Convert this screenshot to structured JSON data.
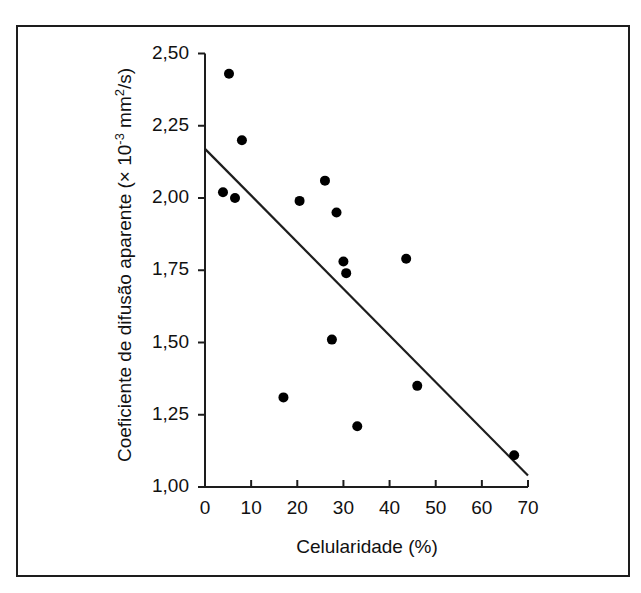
{
  "figure": {
    "background_color": "#ffffff",
    "frame_color": "#1d1d1d",
    "marker_color": "#000000",
    "line_color": "#1d1d1d"
  },
  "chart_data": {
    "type": "scatter",
    "title": "",
    "xlabel": "Celularidade (%)",
    "ylabel_parts": {
      "prefix": "Coeficiente de difusão aparente (× 10",
      "exponent": "-3",
      "suffix_a": " mm",
      "suffix_exp": "2",
      "suffix_b": "/s)"
    },
    "ylabel": "Coeficiente de difusão aparente (× 10-3 mm2/s)",
    "xlim": [
      0,
      70
    ],
    "ylim": [
      1.0,
      2.5
    ],
    "xticks": [
      0,
      10,
      20,
      30,
      40,
      50,
      60,
      70
    ],
    "yticks": [
      1.0,
      1.25,
      1.5,
      1.75,
      2.0,
      2.25,
      2.5
    ],
    "xtick_labels": [
      "0",
      "10",
      "20",
      "30",
      "40",
      "50",
      "60",
      "70"
    ],
    "ytick_labels": [
      "1,00",
      "1,25",
      "1,50",
      "1,75",
      "2,00",
      "2,25",
      "2,50"
    ],
    "grid": false,
    "legend": null,
    "x": [
      3.9,
      5.2,
      6.5,
      8.0,
      17.0,
      20.5,
      26.0,
      27.5,
      28.5,
      30.0,
      30.6,
      33.0,
      43.6,
      46.0,
      67.0
    ],
    "y": [
      2.02,
      2.43,
      2.0,
      2.2,
      1.31,
      1.99,
      2.06,
      1.51,
      1.95,
      1.78,
      1.74,
      1.21,
      1.79,
      1.35,
      1.11
    ],
    "points": [
      {
        "x": 3.9,
        "y": 2.02
      },
      {
        "x": 5.2,
        "y": 2.43
      },
      {
        "x": 6.5,
        "y": 2.0
      },
      {
        "x": 8.0,
        "y": 2.2
      },
      {
        "x": 17.0,
        "y": 1.31
      },
      {
        "x": 20.5,
        "y": 1.99
      },
      {
        "x": 26.0,
        "y": 2.06
      },
      {
        "x": 27.5,
        "y": 1.51
      },
      {
        "x": 28.5,
        "y": 1.95
      },
      {
        "x": 30.0,
        "y": 1.78
      },
      {
        "x": 30.6,
        "y": 1.74
      },
      {
        "x": 33.0,
        "y": 1.21
      },
      {
        "x": 43.6,
        "y": 1.79
      },
      {
        "x": 46.0,
        "y": 1.35
      },
      {
        "x": 67.0,
        "y": 1.11
      }
    ],
    "trendline": {
      "type": "line",
      "x0": 0.0,
      "y0": 2.17,
      "x1": 70.0,
      "y1": 1.04
    },
    "marker_radius_px": 5
  }
}
